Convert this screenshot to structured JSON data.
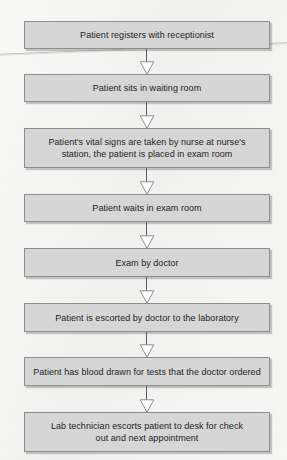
{
  "document": {
    "type": "flowchart",
    "orientation": "vertical-top-to-bottom",
    "title": "Patient visit process flow chart",
    "node_count": 8,
    "colors": {
      "node_fill": "#d6d6d6",
      "node_border": "#8e8e8e",
      "connector": "#5a5a5a",
      "arrowhead_fill": "#ffffff",
      "arrowhead_stroke": "#8e8e8e",
      "page_background": "#f1f1ef",
      "text": "#1d1d1d"
    }
  },
  "flow": {
    "nodes": [
      {
        "id": "step-1",
        "label": "Patient registers with receptionist",
        "lines": 1
      },
      {
        "id": "step-2",
        "label": "Patient sits in waiting room",
        "lines": 1
      },
      {
        "id": "step-3",
        "label": "Patient's vital signs are taken by nurse at nurse's\nstation, the patient is placed in exam room",
        "lines": 2
      },
      {
        "id": "step-4",
        "label": "Patient waits in exam room",
        "lines": 1
      },
      {
        "id": "step-5",
        "label": "Exam by doctor",
        "lines": 1
      },
      {
        "id": "step-6",
        "label": "Patient is escorted by doctor to the laboratory",
        "lines": 1
      },
      {
        "id": "step-7",
        "label": "Patient has blood drawn for tests that the doctor ordered",
        "lines": 1
      },
      {
        "id": "step-8",
        "label": "Lab technician escorts patient to desk for check\nout and next appointment",
        "lines": 2
      }
    ],
    "connectors": [
      {
        "from": "step-1",
        "to": "step-2",
        "arrow": "open-triangle-down"
      },
      {
        "from": "step-2",
        "to": "step-3",
        "arrow": "open-triangle-down"
      },
      {
        "from": "step-3",
        "to": "step-4",
        "arrow": "open-triangle-down"
      },
      {
        "from": "step-4",
        "to": "step-5",
        "arrow": "open-triangle-down"
      },
      {
        "from": "step-5",
        "to": "step-6",
        "arrow": "open-triangle-down"
      },
      {
        "from": "step-6",
        "to": "step-7",
        "arrow": "open-triangle-down"
      },
      {
        "from": "step-7",
        "to": "step-8",
        "arrow": "open-triangle-down"
      }
    ]
  }
}
